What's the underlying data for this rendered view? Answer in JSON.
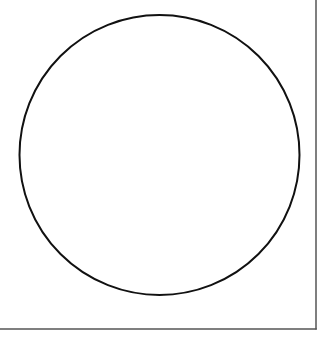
{
  "diagram": {
    "shape": "circle",
    "circle": {
      "cx": 159.5,
      "cy": 155,
      "r": 140,
      "stroke": "#111111",
      "stroke_width": 2,
      "fill": "none"
    },
    "frame": {
      "right_x": 316,
      "bottom_y": 329,
      "stroke": "#555555",
      "stroke_width": 1.5
    },
    "background": "#ffffff"
  }
}
